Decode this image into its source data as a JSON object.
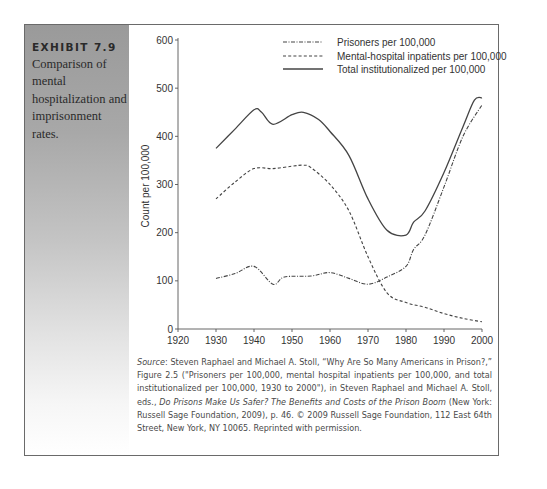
{
  "exhibit": {
    "label": "EXHIBIT 7.9",
    "caption": "Comparison of mental hospitalization and imprisonment rates."
  },
  "chart_data": {
    "type": "line",
    "title": "",
    "xlabel": "",
    "ylabel": "Count per 100,000",
    "xlim": [
      1920,
      2000
    ],
    "ylim": [
      0,
      600
    ],
    "x_ticks": [
      "1920",
      "1930",
      "1940",
      "1950",
      "1960",
      "1970",
      "1980",
      "1990",
      "2000"
    ],
    "y_ticks": [
      "0",
      "100",
      "200",
      "300",
      "400",
      "500",
      "600"
    ],
    "grid": false,
    "legend_position": "top-right",
    "series": [
      {
        "name": "Prisoners per 100,000",
        "style": "dash-dot",
        "x": [
          1930,
          1935,
          1940,
          1945,
          1948,
          1955,
          1960,
          1965,
          1970,
          1975,
          1980,
          1982,
          1985,
          1990,
          1995,
          2000
        ],
        "values": [
          105,
          115,
          130,
          93,
          108,
          110,
          117,
          105,
          93,
          108,
          130,
          165,
          195,
          295,
          400,
          465
        ]
      },
      {
        "name": "Mental-hospital inpatients per 100,000",
        "style": "dashed",
        "x": [
          1930,
          1935,
          1940,
          1945,
          1950,
          1953,
          1955,
          1960,
          1965,
          1970,
          1975,
          1980,
          1985,
          1990,
          1995,
          2000
        ],
        "values": [
          270,
          305,
          333,
          333,
          338,
          340,
          335,
          300,
          245,
          150,
          75,
          55,
          45,
          32,
          22,
          15
        ]
      },
      {
        "name": "Total institutionalized per 100,000",
        "style": "solid",
        "x": [
          1930,
          1935,
          1940,
          1942,
          1945,
          1950,
          1953,
          1957,
          1960,
          1965,
          1970,
          1975,
          1980,
          1982,
          1985,
          1990,
          1995,
          1998,
          2000
        ],
        "values": [
          375,
          415,
          455,
          450,
          425,
          445,
          450,
          435,
          410,
          360,
          270,
          205,
          195,
          222,
          245,
          325,
          420,
          475,
          480
        ]
      }
    ]
  },
  "source": {
    "label": "Source",
    "part1": ": Steven Raphael and Michael A. Stoll, “Why Are So Many Americans in Prison?,” Figure 2.5 (\"Prisoners per 100,000, mental hospital inpatients per 100,000, and total institutionalized per 100,000, 1930 to 2000\"), in Steven Raphael and Michael A. Stoll, eds., ",
    "book_title": "Do Prisons Make Us Safer? The Benefits and Costs of the Prison Boom",
    "part2": " (New York: Russell Sage Foundation, 2009), p. 46. © 2009 Russell Sage Foundation, 112 East 64th Street, New York, NY 10065. Reprinted with permission."
  },
  "colors": {
    "line": "#444444",
    "axis": "#555555",
    "panel_top": "#9a9a9a",
    "panel_bottom": "#ffffff",
    "text": "#2a2a2a"
  }
}
